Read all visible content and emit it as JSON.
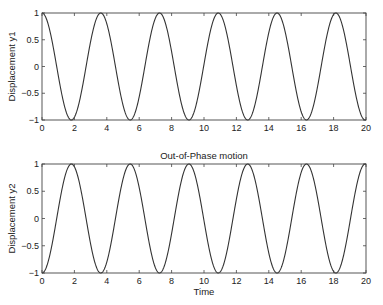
{
  "chart_data": [
    {
      "type": "line",
      "title": "",
      "xlabel": "",
      "ylabel": "Displacement y1",
      "xlim": [
        0,
        20
      ],
      "ylim": [
        -1,
        1
      ],
      "xticks": [
        0,
        2,
        4,
        6,
        8,
        10,
        12,
        14,
        16,
        18,
        20
      ],
      "yticks": [
        -1,
        -0.5,
        0,
        0.5,
        1
      ],
      "ytick_labels": [
        "−1",
        "−0.5",
        "0",
        "0.5",
        "1"
      ],
      "grid": false,
      "series": [
        {
          "name": "y1",
          "function": "cos(1.732*t)",
          "omega": 1.732,
          "phase": 0,
          "amplitude": 1,
          "peaks_at": [
            0,
            3.63,
            7.26,
            10.88,
            14.51,
            18.14
          ],
          "troughs_at": [
            1.81,
            5.44,
            9.07,
            12.7,
            16.32,
            19.95
          ]
        }
      ]
    },
    {
      "type": "line",
      "title": "Out-of-Phase motion",
      "xlabel": "Time",
      "ylabel": "Displacement y2",
      "xlim": [
        0,
        20
      ],
      "ylim": [
        -1,
        1
      ],
      "xticks": [
        0,
        2,
        4,
        6,
        8,
        10,
        12,
        14,
        16,
        18,
        20
      ],
      "yticks": [
        -1,
        -0.5,
        0,
        0.5,
        1
      ],
      "ytick_labels": [
        "−1",
        "−0.5",
        "0",
        "0.5",
        "1"
      ],
      "grid": false,
      "series": [
        {
          "name": "y2",
          "function": "-cos(1.732*t)",
          "omega": 1.732,
          "phase": 3.14159,
          "amplitude": 1,
          "peaks_at": [
            1.81,
            5.44,
            9.07,
            12.7,
            16.32,
            19.95
          ],
          "troughs_at": [
            0,
            3.63,
            7.26,
            10.88,
            14.51,
            18.14
          ]
        }
      ]
    }
  ],
  "style": {
    "line_color": "#333333",
    "axis_color": "#444444"
  }
}
